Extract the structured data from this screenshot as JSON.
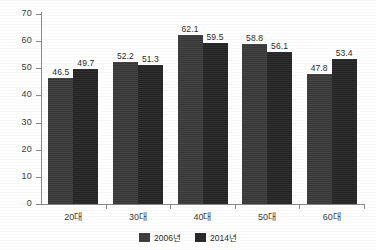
{
  "chart_data": {
    "type": "bar",
    "title": "",
    "xlabel": "",
    "ylabel": "",
    "ylim": [
      0,
      70
    ],
    "ytick_step": 10,
    "yticks": [
      "0",
      "10",
      "20",
      "30",
      "40",
      "50",
      "60",
      "70"
    ],
    "grid": false,
    "legend_position": "bottom-center",
    "categories": [
      "20대",
      "30대",
      "40대",
      "50대",
      "60대"
    ],
    "series": [
      {
        "name": "2006년",
        "color": "#3a3a3a",
        "values": [
          46.5,
          52.2,
          62.1,
          58.8,
          47.8
        ]
      },
      {
        "name": "2014년",
        "color": "#262626",
        "values": [
          49.7,
          51.3,
          59.5,
          56.1,
          53.4
        ]
      }
    ],
    "data_labels": [
      [
        "46.5",
        "52.2",
        "62.1",
        "58.8",
        "47.8"
      ],
      [
        "49.7",
        "51.3",
        "59.5",
        "56.1",
        "53.4"
      ]
    ]
  }
}
